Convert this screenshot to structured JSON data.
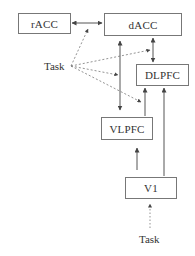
{
  "nodes": {
    "racc": {
      "label": "rACC"
    },
    "dacc": {
      "label": "dACC"
    },
    "dlpfc": {
      "label": "DLPFC"
    },
    "vlpfc": {
      "label": "VLPFC"
    },
    "v1": {
      "label": "V1"
    }
  },
  "labels": {
    "task_left": "Task",
    "task_bottom": "Task"
  },
  "edges": [
    {
      "from": "rACC",
      "to": "dACC",
      "style": "solid",
      "direction": "bidirectional"
    },
    {
      "from": "dACC",
      "to": "DLPFC",
      "style": "solid",
      "direction": "bidirectional"
    },
    {
      "from": "dACC",
      "to": "VLPFC",
      "style": "solid",
      "direction": "bidirectional"
    },
    {
      "from": "VLPFC",
      "to": "DLPFC",
      "style": "solid",
      "direction": "forward"
    },
    {
      "from": "V1",
      "to": "VLPFC",
      "style": "solid",
      "direction": "forward"
    },
    {
      "from": "V1",
      "to": "DLPFC",
      "style": "solid",
      "direction": "forward"
    },
    {
      "from": "Task",
      "to": "rACC-dACC edge",
      "style": "dashed",
      "direction": "forward"
    },
    {
      "from": "Task",
      "to": "dACC-DLPFC edge",
      "style": "dashed",
      "direction": "forward"
    },
    {
      "from": "Task",
      "to": "dACC-VLPFC edge",
      "style": "dashed",
      "direction": "forward"
    },
    {
      "from": "Task",
      "to": "VLPFC-DLPFC edge",
      "style": "dashed",
      "direction": "forward"
    },
    {
      "from": "Task (bottom)",
      "to": "V1",
      "style": "dotted",
      "direction": "forward"
    }
  ],
  "colors": {
    "line": "#555555",
    "dashed": "#777777",
    "border": "#777777"
  }
}
